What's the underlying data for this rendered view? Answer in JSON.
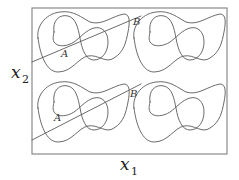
{
  "figure": {
    "type": "contour-diagram",
    "axes": {
      "x": {
        "symbol": "x",
        "subscript": "1"
      },
      "y": {
        "symbol": "x",
        "subscript": "2"
      }
    },
    "tiles": [
      {
        "id": "top-left",
        "point_label": "A"
      },
      {
        "id": "top-right",
        "point_label": ""
      },
      {
        "id": "bottom-left",
        "point_label": "A"
      },
      {
        "id": "bottom-right",
        "point_label": ""
      }
    ],
    "crossing_labels": [
      "B",
      "B"
    ],
    "line_color": "#5a5a5a",
    "frame_color": "#8a8a8a"
  }
}
